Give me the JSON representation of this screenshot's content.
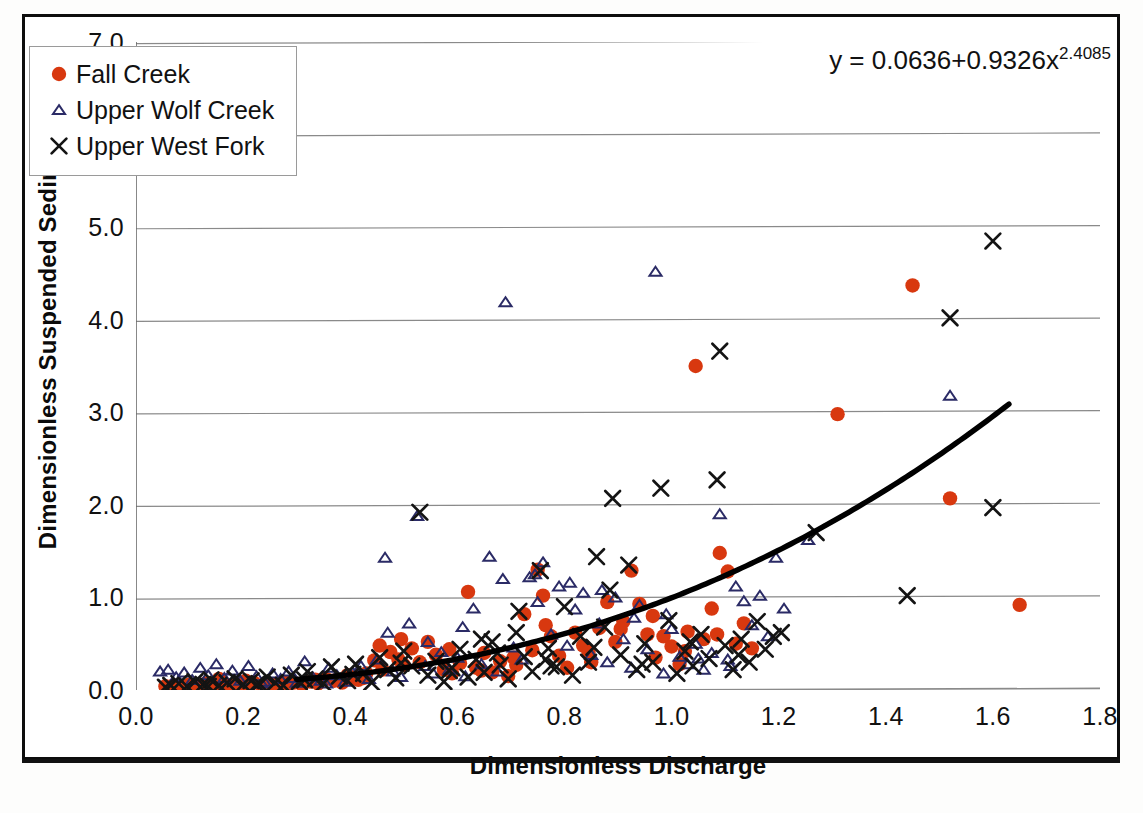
{
  "axes": {
    "x_title": "Dimensionless Discharge",
    "y_title": "Dimensionless Suspended Sediment",
    "x_ticks": [
      "0.0",
      "0.2",
      "0.4",
      "0.6",
      "0.8",
      "1.0",
      "1.2",
      "1.4",
      "1.6",
      "1.8"
    ],
    "y_ticks": [
      "0.0",
      "1.0",
      "2.0",
      "3.0",
      "4.0",
      "5.0",
      "6.0",
      "7.0"
    ]
  },
  "legend": {
    "items": [
      {
        "label": "Fall Creek",
        "marker": "filled-circle",
        "color": "#d8380f"
      },
      {
        "label": "Upper Wolf Creek",
        "marker": "open-triangle",
        "color": "#2b2b66"
      },
      {
        "label": "Upper West Fork",
        "marker": "cross-x",
        "color": "#141414"
      }
    ]
  },
  "annotation": {
    "equation_main": "y = 0.0636+0.9326x",
    "equation_exponent": "2.4085"
  },
  "chart_data": {
    "type": "scatter",
    "title": "",
    "xlabel": "Dimensionless Discharge",
    "ylabel": "Dimensionless Suspended Sediment",
    "xlim": [
      0.0,
      1.8
    ],
    "ylim": [
      0.0,
      7.0
    ],
    "xtick_step": 0.2,
    "ytick_step": 1.0,
    "grid": "horizontal",
    "legend_position": "top-left",
    "colors": {
      "fall_creek": "#d8380f",
      "upper_wolf_creek": "#2b2b66",
      "upper_west_fork": "#141414",
      "trendline": "#000000",
      "gridline": "#8a8a8a",
      "frame": "#0d0d0d"
    },
    "trendline": {
      "label": "y = 0.0636+0.9326x^2.4085",
      "form": "power",
      "intercept": 0.0636,
      "coefficient": 0.9326,
      "exponent": 2.4085,
      "x_start": 0.3,
      "x_end": 1.63
    },
    "series": [
      {
        "name": "Fall Creek",
        "marker": "filled-circle",
        "color": "#d8380f",
        "points": [
          [
            0.055,
            0.04
          ],
          [
            0.07,
            0.05
          ],
          [
            0.09,
            0.03
          ],
          [
            0.1,
            0.06
          ],
          [
            0.115,
            0.04
          ],
          [
            0.13,
            0.07
          ],
          [
            0.145,
            0.05
          ],
          [
            0.16,
            0.09
          ],
          [
            0.175,
            0.05
          ],
          [
            0.19,
            0.06
          ],
          [
            0.205,
            0.04
          ],
          [
            0.22,
            0.08
          ],
          [
            0.235,
            0.05
          ],
          [
            0.25,
            0.06
          ],
          [
            0.265,
            0.07
          ],
          [
            0.28,
            0.05
          ],
          [
            0.295,
            0.08
          ],
          [
            0.31,
            0.06
          ],
          [
            0.325,
            0.09
          ],
          [
            0.34,
            0.07
          ],
          [
            0.355,
            0.12
          ],
          [
            0.37,
            0.1
          ],
          [
            0.385,
            0.08
          ],
          [
            0.4,
            0.14
          ],
          [
            0.415,
            0.11
          ],
          [
            0.43,
            0.18
          ],
          [
            0.445,
            0.32
          ],
          [
            0.46,
            0.22
          ],
          [
            0.475,
            0.41
          ],
          [
            0.49,
            0.33
          ],
          [
            0.5,
            0.27
          ],
          [
            0.515,
            0.45
          ],
          [
            0.53,
            0.3
          ],
          [
            0.545,
            0.52
          ],
          [
            0.56,
            0.38
          ],
          [
            0.575,
            0.22
          ],
          [
            0.59,
            0.18
          ],
          [
            0.605,
            0.29
          ],
          [
            0.62,
            1.06
          ],
          [
            0.635,
            0.24
          ],
          [
            0.65,
            0.4
          ],
          [
            0.665,
            0.19
          ],
          [
            0.68,
            0.31
          ],
          [
            0.695,
            0.15
          ],
          [
            0.71,
            0.27
          ],
          [
            0.725,
            0.82
          ],
          [
            0.74,
            0.43
          ],
          [
            0.75,
            1.3
          ],
          [
            0.76,
            1.02
          ],
          [
            0.775,
            0.58
          ],
          [
            0.79,
            0.37
          ],
          [
            0.805,
            0.24
          ],
          [
            0.82,
            0.62
          ],
          [
            0.835,
            0.48
          ],
          [
            0.85,
            0.3
          ],
          [
            0.865,
            0.67
          ],
          [
            0.88,
            0.95
          ],
          [
            0.895,
            0.52
          ],
          [
            0.91,
            0.74
          ],
          [
            0.925,
            1.29
          ],
          [
            0.94,
            0.93
          ],
          [
            0.955,
            0.6
          ],
          [
            0.97,
            0.35
          ],
          [
            0.985,
            0.58
          ],
          [
            1.0,
            0.47
          ],
          [
            1.015,
            0.28
          ],
          [
            1.03,
            0.63
          ],
          [
            1.045,
            3.5
          ],
          [
            1.06,
            0.55
          ],
          [
            1.075,
            0.88
          ],
          [
            1.09,
            1.48
          ],
          [
            1.105,
            1.28
          ],
          [
            1.12,
            0.5
          ],
          [
            1.135,
            0.72
          ],
          [
            1.15,
            0.45
          ],
          [
            1.31,
            2.98
          ],
          [
            1.45,
            4.37
          ],
          [
            1.52,
            2.07
          ],
          [
            1.65,
            0.92
          ],
          [
            0.205,
            0.1
          ],
          [
            0.155,
            0.12
          ],
          [
            0.455,
            0.48
          ],
          [
            0.495,
            0.55
          ],
          [
            0.585,
            0.44
          ],
          [
            0.645,
            0.21
          ],
          [
            0.705,
            0.35
          ],
          [
            0.765,
            0.7
          ],
          [
            0.845,
            0.41
          ],
          [
            0.905,
            0.66
          ],
          [
            0.965,
            0.8
          ],
          [
            1.025,
            0.42
          ],
          [
            1.085,
            0.6
          ],
          [
            0.275,
            0.09
          ],
          [
            0.335,
            0.11
          ],
          [
            0.395,
            0.16
          ],
          [
            0.425,
            0.13
          ]
        ]
      },
      {
        "name": "Upper Wolf Creek",
        "marker": "open-triangle",
        "color": "#2b2b66",
        "points": [
          [
            0.06,
            0.22
          ],
          [
            0.075,
            0.14
          ],
          [
            0.09,
            0.19
          ],
          [
            0.105,
            0.11
          ],
          [
            0.12,
            0.24
          ],
          [
            0.135,
            0.16
          ],
          [
            0.15,
            0.28
          ],
          [
            0.165,
            0.13
          ],
          [
            0.18,
            0.21
          ],
          [
            0.195,
            0.1
          ],
          [
            0.21,
            0.26
          ],
          [
            0.225,
            0.15
          ],
          [
            0.24,
            0.09
          ],
          [
            0.255,
            0.18
          ],
          [
            0.27,
            0.12
          ],
          [
            0.285,
            0.2
          ],
          [
            0.3,
            0.08
          ],
          [
            0.315,
            0.31
          ],
          [
            0.33,
            0.14
          ],
          [
            0.345,
            0.1
          ],
          [
            0.36,
            0.24
          ],
          [
            0.375,
            0.16
          ],
          [
            0.39,
            0.09
          ],
          [
            0.405,
            0.19
          ],
          [
            0.42,
            0.26
          ],
          [
            0.435,
            0.12
          ],
          [
            0.45,
            0.33
          ],
          [
            0.465,
            1.43
          ],
          [
            0.48,
            0.2
          ],
          [
            0.495,
            0.14
          ],
          [
            0.51,
            0.72
          ],
          [
            0.525,
            1.88
          ],
          [
            0.54,
            0.26
          ],
          [
            0.555,
            0.18
          ],
          [
            0.57,
            0.41
          ],
          [
            0.585,
            0.22
          ],
          [
            0.6,
            0.35
          ],
          [
            0.615,
            0.15
          ],
          [
            0.63,
            0.88
          ],
          [
            0.645,
            0.28
          ],
          [
            0.66,
            1.44
          ],
          [
            0.675,
            0.2
          ],
          [
            0.69,
            4.19
          ],
          [
            0.705,
            0.46
          ],
          [
            0.72,
            0.33
          ],
          [
            0.735,
            1.22
          ],
          [
            0.75,
            0.95
          ],
          [
            0.76,
            1.38
          ],
          [
            0.775,
            0.6
          ],
          [
            0.79,
            1.12
          ],
          [
            0.805,
            0.48
          ],
          [
            0.82,
            0.87
          ],
          [
            0.835,
            1.05
          ],
          [
            0.85,
            0.38
          ],
          [
            0.865,
            0.72
          ],
          [
            0.88,
            0.3
          ],
          [
            0.895,
            1.0
          ],
          [
            0.91,
            0.55
          ],
          [
            0.925,
            0.24
          ],
          [
            0.94,
            0.92
          ],
          [
            0.955,
            0.44
          ],
          [
            0.97,
            4.52
          ],
          [
            0.985,
            0.18
          ],
          [
            1.0,
            0.66
          ],
          [
            1.015,
            0.36
          ],
          [
            1.03,
            0.28
          ],
          [
            1.045,
            0.5
          ],
          [
            1.06,
            0.22
          ],
          [
            1.075,
            0.4
          ],
          [
            1.09,
            1.9
          ],
          [
            1.105,
            0.33
          ],
          [
            1.12,
            1.12
          ],
          [
            1.135,
            0.96
          ],
          [
            1.15,
            0.7
          ],
          [
            1.165,
            1.02
          ],
          [
            1.18,
            0.58
          ],
          [
            1.195,
            1.43
          ],
          [
            1.21,
            0.88
          ],
          [
            1.255,
            1.62
          ],
          [
            1.52,
            3.18
          ],
          [
            0.045,
            0.2
          ],
          [
            0.47,
            0.62
          ],
          [
            0.545,
            0.52
          ],
          [
            0.61,
            0.68
          ],
          [
            0.685,
            1.2
          ],
          [
            0.745,
            1.25
          ],
          [
            0.81,
            1.16
          ],
          [
            0.87,
            1.08
          ],
          [
            0.93,
            0.78
          ],
          [
            0.99,
            0.82
          ],
          [
            1.05,
            0.34
          ],
          [
            1.11,
            0.26
          ],
          [
            0.355,
            0.07
          ],
          [
            0.295,
            0.13
          ],
          [
            0.235,
            0.07
          ]
        ]
      },
      {
        "name": "Upper West Fork",
        "marker": "cross-x",
        "color": "#141414",
        "points": [
          [
            0.065,
            0.05
          ],
          [
            0.08,
            0.07
          ],
          [
            0.095,
            0.04
          ],
          [
            0.11,
            0.09
          ],
          [
            0.125,
            0.06
          ],
          [
            0.14,
            0.11
          ],
          [
            0.155,
            0.05
          ],
          [
            0.17,
            0.08
          ],
          [
            0.185,
            0.12
          ],
          [
            0.2,
            0.06
          ],
          [
            0.215,
            0.1
          ],
          [
            0.23,
            0.07
          ],
          [
            0.245,
            0.14
          ],
          [
            0.26,
            0.08
          ],
          [
            0.275,
            0.05
          ],
          [
            0.29,
            0.16
          ],
          [
            0.305,
            0.09
          ],
          [
            0.32,
            0.2
          ],
          [
            0.335,
            0.12
          ],
          [
            0.35,
            0.07
          ],
          [
            0.365,
            0.25
          ],
          [
            0.38,
            0.15
          ],
          [
            0.395,
            0.1
          ],
          [
            0.41,
            0.28
          ],
          [
            0.425,
            0.18
          ],
          [
            0.44,
            0.08
          ],
          [
            0.455,
            0.35
          ],
          [
            0.47,
            0.22
          ],
          [
            0.485,
            0.13
          ],
          [
            0.5,
            0.42
          ],
          [
            0.515,
            0.26
          ],
          [
            0.53,
            1.92
          ],
          [
            0.545,
            0.16
          ],
          [
            0.56,
            0.31
          ],
          [
            0.575,
            0.09
          ],
          [
            0.59,
            0.24
          ],
          [
            0.605,
            0.44
          ],
          [
            0.62,
            0.14
          ],
          [
            0.635,
            0.33
          ],
          [
            0.65,
            0.19
          ],
          [
            0.665,
            0.52
          ],
          [
            0.68,
            0.27
          ],
          [
            0.695,
            0.12
          ],
          [
            0.71,
            0.62
          ],
          [
            0.725,
            0.36
          ],
          [
            0.74,
            0.2
          ],
          [
            0.755,
            1.29
          ],
          [
            0.77,
            0.45
          ],
          [
            0.785,
            0.25
          ],
          [
            0.8,
            0.9
          ],
          [
            0.815,
            0.16
          ],
          [
            0.83,
            0.58
          ],
          [
            0.845,
            0.3
          ],
          [
            0.86,
            1.44
          ],
          [
            0.875,
            0.68
          ],
          [
            0.89,
            2.07
          ],
          [
            0.905,
            0.38
          ],
          [
            0.92,
            1.35
          ],
          [
            0.935,
            0.22
          ],
          [
            0.95,
            0.5
          ],
          [
            0.965,
            0.3
          ],
          [
            0.98,
            2.18
          ],
          [
            0.995,
            0.75
          ],
          [
            1.01,
            0.18
          ],
          [
            1.025,
            0.42
          ],
          [
            1.04,
            0.26
          ],
          [
            1.055,
            0.6
          ],
          [
            1.07,
            0.34
          ],
          [
            1.085,
            2.27
          ],
          [
            1.09,
            3.66
          ],
          [
            1.1,
            0.48
          ],
          [
            1.115,
            0.22
          ],
          [
            1.13,
            0.55
          ],
          [
            1.145,
            0.3
          ],
          [
            1.16,
            0.74
          ],
          [
            1.175,
            0.44
          ],
          [
            1.19,
            0.58
          ],
          [
            1.205,
            0.62
          ],
          [
            1.27,
            1.7
          ],
          [
            1.44,
            1.02
          ],
          [
            1.52,
            4.02
          ],
          [
            1.6,
            4.85
          ],
          [
            1.6,
            1.97
          ],
          [
            0.055,
            0.03
          ],
          [
            0.135,
            0.04
          ],
          [
            0.225,
            0.06
          ],
          [
            0.315,
            0.11
          ],
          [
            0.405,
            0.17
          ],
          [
            0.495,
            0.29
          ],
          [
            0.585,
            0.21
          ],
          [
            0.675,
            0.4
          ],
          [
            0.765,
            0.33
          ],
          [
            0.855,
            0.46
          ],
          [
            0.945,
            0.28
          ],
          [
            1.035,
            0.52
          ],
          [
            1.125,
            0.38
          ],
          [
            0.715,
            0.85
          ],
          [
            0.885,
            1.08
          ],
          [
            0.775,
            0.26
          ],
          [
            0.645,
            0.55
          ]
        ]
      }
    ]
  }
}
